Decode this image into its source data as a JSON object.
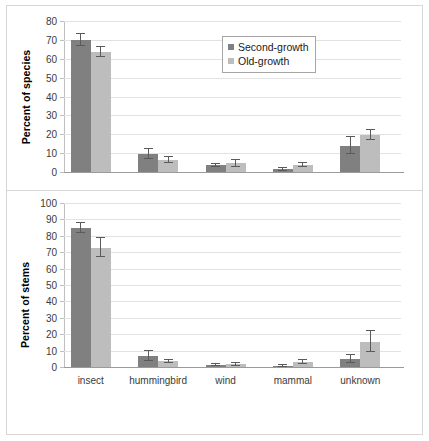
{
  "figure": {
    "background": "#ffffff",
    "border_color": "#d6d6d6"
  },
  "legend": {
    "position": "top-center-right",
    "entries": [
      {
        "label": "Second-growth",
        "color": "#808080",
        "swatch_name": "legend-swatch-second-growth"
      },
      {
        "label": "Old-growth",
        "color": "#bdbdbd",
        "swatch_name": "legend-swatch-old-growth"
      }
    ]
  },
  "chart_data": [
    {
      "panel": "top",
      "type": "bar",
      "title": "",
      "xlabel": "",
      "ylabel": "Percent of species",
      "ylim": [
        0,
        80
      ],
      "yticks": [
        0,
        10,
        20,
        30,
        40,
        50,
        60,
        70,
        80
      ],
      "grid": true,
      "categories": [
        "insect",
        "hummingbird",
        "wind",
        "mammal",
        "unknown"
      ],
      "series": [
        {
          "name": "Second-growth",
          "color": "#808080",
          "values": [
            70.0,
            9.6,
            3.5,
            1.4,
            14.0
          ],
          "errors": [
            3.0,
            2.6,
            1.0,
            0.6,
            4.3
          ]
        },
        {
          "name": "Old-growth",
          "color": "#bdbdbd",
          "values": [
            63.5,
            6.3,
            4.6,
            3.8,
            19.6
          ],
          "errors": [
            2.8,
            1.6,
            2.0,
            1.2,
            2.6
          ]
        }
      ]
    },
    {
      "panel": "bottom",
      "type": "bar",
      "title": "",
      "xlabel": "",
      "ylabel": "Percent of stems",
      "ylim": [
        0,
        100
      ],
      "yticks": [
        0,
        10,
        20,
        30,
        40,
        50,
        60,
        70,
        80,
        90,
        100
      ],
      "grid": true,
      "categories": [
        "insect",
        "hummingbird",
        "wind",
        "mammal",
        "unknown"
      ],
      "series": [
        {
          "name": "Second-growth",
          "color": "#808080",
          "values": [
            84.7,
            6.9,
            1.0,
            0.6,
            5.0
          ],
          "errors": [
            3.1,
            3.1,
            0.6,
            0.4,
            2.6
          ]
        },
        {
          "name": "Old-growth",
          "color": "#bdbdbd",
          "values": [
            72.7,
            3.5,
            1.7,
            2.9,
            15.5
          ],
          "errors": [
            5.7,
            0.9,
            1.0,
            1.3,
            6.5
          ]
        }
      ]
    }
  ]
}
